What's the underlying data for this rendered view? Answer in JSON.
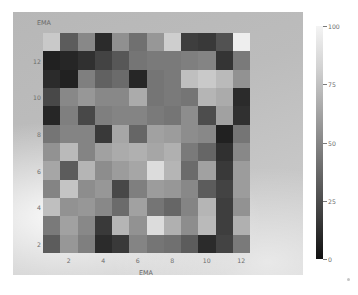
{
  "figure": {
    "background_color": "#ffffff",
    "panel_color": "#bdbdbd"
  },
  "axes": {
    "x_title": "EMA",
    "y_title": "EMA",
    "x_ticks": [
      "2",
      "4",
      "6",
      "8",
      "10",
      "12"
    ],
    "y_ticks": [
      "12",
      "10",
      "8",
      "6",
      "4",
      "2"
    ]
  },
  "colorbar": {
    "ticks": [
      "100",
      "75",
      "50",
      "25",
      "0"
    ],
    "min": 0,
    "max": 100,
    "low_color": "#101010",
    "high_color": "#f4f4f4"
  },
  "chart_data": {
    "type": "heatmap",
    "title": "",
    "xlabel": "EMA",
    "ylabel": "EMA",
    "colormap": "gray",
    "grid": false,
    "legend": "colorbar-right",
    "zlim": [
      0,
      100
    ],
    "xlim": [
      0.5,
      12.5
    ],
    "ylim": [
      0.5,
      13.5
    ],
    "x": [
      1,
      2,
      3,
      4,
      5,
      6,
      7,
      8,
      9,
      10,
      11,
      12
    ],
    "y": [
      13,
      12,
      11,
      10,
      9,
      8,
      7,
      6,
      5,
      4,
      3,
      2,
      1
    ],
    "row_order": "top-to-bottom",
    "values": [
      [
        78,
        34,
        52,
        14,
        55,
        42,
        58,
        80,
        22,
        20,
        30,
        93
      ],
      [
        10,
        12,
        16,
        24,
        32,
        44,
        46,
        46,
        48,
        50,
        18,
        46
      ],
      [
        14,
        10,
        48,
        36,
        40,
        12,
        44,
        46,
        74,
        78,
        72,
        56
      ],
      [
        26,
        52,
        58,
        52,
        52,
        66,
        44,
        46,
        44,
        70,
        66,
        14
      ],
      [
        12,
        48,
        26,
        48,
        50,
        50,
        46,
        44,
        54,
        28,
        62,
        16
      ],
      [
        44,
        50,
        50,
        20,
        64,
        38,
        62,
        60,
        54,
        52,
        10,
        44
      ],
      [
        56,
        72,
        50,
        62,
        66,
        68,
        64,
        68,
        46,
        38,
        16,
        52
      ],
      [
        64,
        34,
        70,
        54,
        60,
        64,
        86,
        70,
        40,
        62,
        20,
        60
      ],
      [
        50,
        76,
        54,
        58,
        26,
        48,
        60,
        58,
        52,
        34,
        24,
        60
      ],
      [
        74,
        56,
        58,
        52,
        40,
        62,
        44,
        38,
        50,
        70,
        22,
        56
      ],
      [
        46,
        62,
        52,
        20,
        70,
        56,
        86,
        68,
        54,
        72,
        22,
        68
      ],
      [
        34,
        58,
        48,
        14,
        20,
        50,
        44,
        42,
        34,
        14,
        24,
        46
      ]
    ]
  }
}
